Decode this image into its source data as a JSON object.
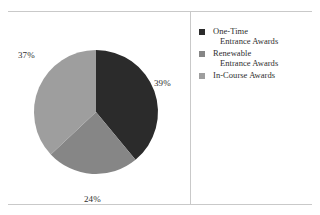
{
  "chart_data": {
    "type": "pie",
    "title": "",
    "categories": [
      "One-Time Entrance Awards",
      "Renewable Entrance Awards",
      "In-Course Awards"
    ],
    "values": [
      39,
      24,
      37
    ],
    "value_labels": [
      "39%",
      "24%",
      "37%"
    ],
    "units": "percent",
    "legend_position": "right",
    "grid": false,
    "start_angle_deg": 0,
    "direction": "clockwise",
    "slice_colors": [
      "#2b2b2b",
      "#868686",
      "#9e9e9e"
    ]
  },
  "legend": {
    "items": [
      {
        "line1": "One-Time",
        "line2": "Entrance Awards",
        "swatch_color": "#2b2b2b",
        "swatch_name": "legend-swatch-one-time"
      },
      {
        "line1": "Renewable",
        "line2": "Entrance  Awards",
        "swatch_color": "#868686",
        "swatch_name": "legend-swatch-renewable"
      },
      {
        "line1": "In-Course Awards",
        "line2": "",
        "swatch_color": "#9e9e9e",
        "swatch_name": "legend-swatch-in-course"
      }
    ]
  },
  "labels": {
    "one_time": "39%",
    "renewable": "24%",
    "in_course": "37%"
  },
  "colors": {
    "slice_dark": "#2b2b2b",
    "slice_medium": "#868686",
    "slice_light": "#9e9e9e",
    "rule": "#c9c9c9",
    "text": "#2e2e2e",
    "background": "#ffffff"
  }
}
